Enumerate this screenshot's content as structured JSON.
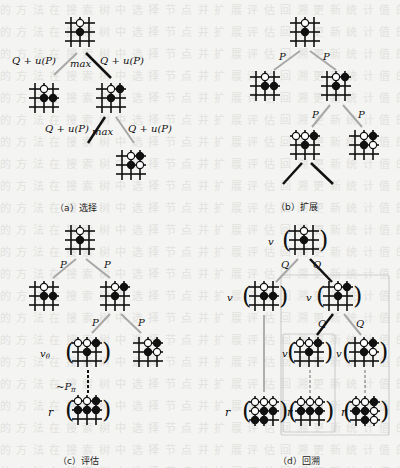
{
  "figure": {
    "panels": [
      {
        "id": "a",
        "caption": "（a）选择",
        "edge_label": "Q + u(P)",
        "max_label": "max"
      },
      {
        "id": "b",
        "caption": "（b）扩展",
        "edge_label": "P"
      },
      {
        "id": "c",
        "caption": "（c）评估",
        "edge_label": "P",
        "value_label": "v",
        "value_sub": "θ",
        "rollout_label": "~P",
        "rollout_sub": "π",
        "reward_label": "r"
      },
      {
        "id": "d",
        "caption": "（d）回溯",
        "edge_label": "Q",
        "value_label": "v",
        "value_sub": "θ",
        "reward_label": "r"
      }
    ]
  },
  "colors": {
    "line": "#111111",
    "gray_edge": "#a8a8a8",
    "box": "#cfcfcf",
    "background": "#f4f4f2"
  }
}
